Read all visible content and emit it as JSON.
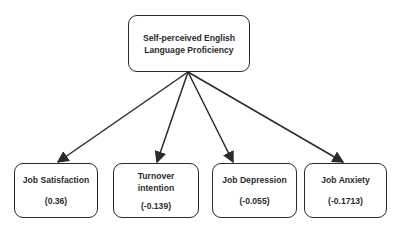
{
  "diagram": {
    "root": {
      "label_line1": "Self-perceived English",
      "label_line2": "Language Proficiency"
    },
    "children": [
      {
        "label": "Job Satisfaction",
        "value": "(0.36)"
      },
      {
        "label_line1": "Turnover",
        "label_line2": "intention",
        "value": "(-0.139)"
      },
      {
        "label": "Job Depression",
        "value": "(-0.055)"
      },
      {
        "label": "Job Anxiety",
        "value": "(-0.1713)"
      }
    ],
    "colors": {
      "stroke": "#2b2b2b",
      "background": "#ffffff"
    }
  }
}
